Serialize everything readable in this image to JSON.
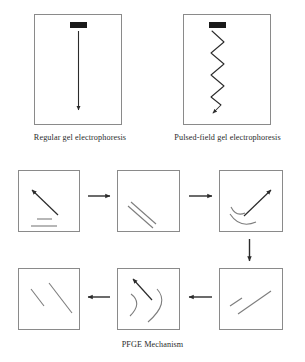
{
  "figure": {
    "title": "PFGE Mechanism",
    "background_color": "#ffffff",
    "box_border_color": "#8a8a8a",
    "ink_color": "#2b2b2b",
    "dna_color": "#7d7d7d"
  },
  "gel_panels": [
    {
      "id": "regular-gel",
      "caption": "Regular gel electrophoresis",
      "well_label": "sample well",
      "migration_path": "straight vertical arrow"
    },
    {
      "id": "pulsed-field-gel",
      "caption": "Pulsed-field gel electrophoresis",
      "well_label": "sample well",
      "migration_path": "zigzag arrow"
    }
  ],
  "mechanism": {
    "caption": "PFGE Mechanism",
    "steps": [
      {
        "id": "step-1",
        "position": "top-left",
        "field_direction": "up-left",
        "dna_state": "relaxed horizontal molecules"
      },
      {
        "id": "step-2",
        "position": "top-center",
        "field_direction": "none",
        "dna_state": "stretched diagonal molecules"
      },
      {
        "id": "step-3",
        "position": "top-right",
        "field_direction": "up-right",
        "dna_state": "reorienting curved molecules"
      },
      {
        "id": "step-4",
        "position": "bottom-right",
        "field_direction": "none",
        "dna_state": "stretched diagonal molecules"
      },
      {
        "id": "step-5",
        "position": "bottom-center",
        "field_direction": "up-left",
        "dna_state": "reorienting curved molecules"
      },
      {
        "id": "step-6",
        "position": "bottom-left",
        "field_direction": "none",
        "dna_state": "stretched diagonal molecules"
      }
    ],
    "connectors": [
      {
        "id": "connector-1-2",
        "direction": "right"
      },
      {
        "id": "connector-2-3",
        "direction": "right"
      },
      {
        "id": "connector-3-4",
        "direction": "down"
      },
      {
        "id": "connector-4-5",
        "direction": "left"
      },
      {
        "id": "connector-5-6",
        "direction": "left"
      }
    ]
  }
}
